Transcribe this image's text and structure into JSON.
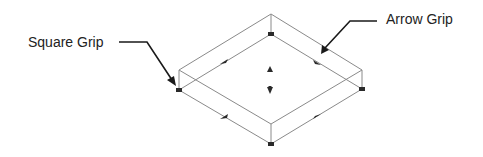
{
  "diagram": {
    "labels": {
      "square_grip": "Square Grip",
      "arrow_grip": "Arrow Grip"
    },
    "colors": {
      "edge": "#8a8a8a",
      "grip": "#2a2a2a",
      "leader": "#1a1a1a",
      "text": "#222222",
      "background": "#ffffff"
    },
    "box": {
      "top_face": {
        "top": [
          271,
          14
        ],
        "left": [
          179,
          70
        ],
        "right": [
          362,
          70
        ],
        "bottom": [
          271,
          124
        ]
      },
      "bottom_face": {
        "top": [
          271,
          34
        ],
        "left": [
          179,
          90
        ],
        "right": [
          362,
          89
        ],
        "bottom": [
          271,
          144
        ]
      }
    },
    "square_grips": [
      {
        "name": "top-corner",
        "x": 271,
        "y": 34
      },
      {
        "name": "left-corner",
        "x": 179,
        "y": 90
      },
      {
        "name": "right-corner",
        "x": 362,
        "y": 89
      },
      {
        "name": "bottom-corner",
        "x": 271,
        "y": 144
      }
    ],
    "arrow_grips": [
      {
        "name": "upper-left-edge",
        "x": 224,
        "y": 62
      },
      {
        "name": "upper-right-edge",
        "x": 317,
        "y": 62
      },
      {
        "name": "lower-left-edge",
        "x": 224,
        "y": 117
      },
      {
        "name": "lower-right-edge",
        "x": 317,
        "y": 116
      },
      {
        "name": "height-up",
        "x": 270,
        "y": 69
      },
      {
        "name": "height-down",
        "x": 270,
        "y": 91
      }
    ]
  }
}
